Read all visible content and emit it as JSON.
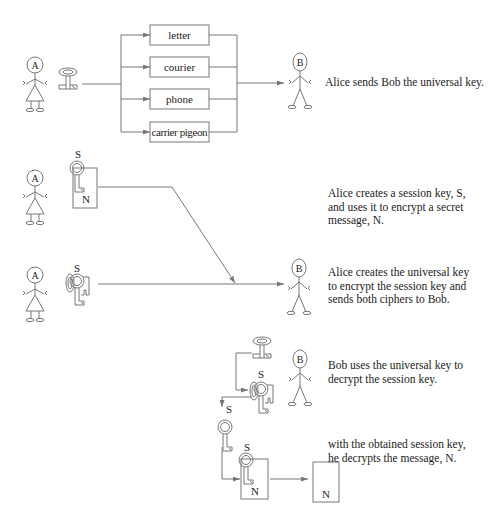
{
  "actors": {
    "alice": "A",
    "bob": "B"
  },
  "channels": [
    "letter",
    "courier",
    "phone",
    "carrier pigeon"
  ],
  "keys": {
    "session_key": "S",
    "message": "N"
  },
  "steps": [
    {
      "caption": "Alice sends Bob the universal key."
    },
    {
      "caption": "Alice creates a session key, S, and uses it to encrypt a secret message, N."
    },
    {
      "caption": "Alice creates the universal key to encrypt the session key and sends both ciphers to Bob."
    },
    {
      "caption": "Bob uses the universal key to decrypt the session key."
    },
    {
      "caption": "with the obtained session key, he decrypts the message, N."
    }
  ],
  "colors": {
    "line": "#777777",
    "text": "#222222"
  }
}
